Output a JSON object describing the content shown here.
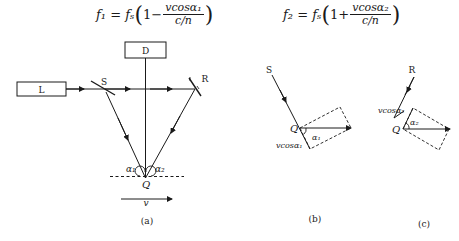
{
  "formulas": [
    {
      "lhs": "f₁",
      "eq": "=",
      "fs": "fₛ",
      "one": "1",
      "op": "−",
      "num": "vcosα₁",
      "den": "c/n"
    },
    {
      "lhs": "f₂",
      "eq": "=",
      "fs": "fₛ",
      "one": "1",
      "op": "+",
      "num": "vcosα₂",
      "den": "c/n"
    }
  ],
  "diagram_a": {
    "detector_label": "D",
    "laser_label": "L",
    "splitter_label": "S",
    "reflector_label": "R",
    "point_label": "Q",
    "angle1_label": "α₁",
    "angle2_label": "α₂",
    "velocity_label": "v",
    "caption": "(a)"
  },
  "diagram_b": {
    "source_label": "S",
    "point_label": "Q",
    "angle_label": "α₁",
    "component_label": "vcosα₁",
    "caption": "(b)"
  },
  "diagram_c": {
    "source_label": "R",
    "point_label": "Q",
    "angle_label": "α₂",
    "component_label": "vcosα₂",
    "caption": "(c)"
  }
}
